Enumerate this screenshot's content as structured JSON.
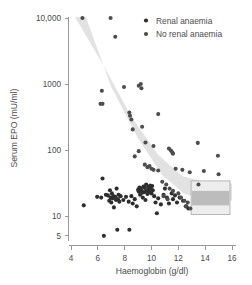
{
  "figure": {
    "name": "serum-epo-vs-haemoglobin-scatter",
    "background": "#ffffff"
  },
  "chart_data": {
    "type": "scatter",
    "title": "",
    "xlabel": "Haemoglobin (g/dl)",
    "ylabel": "Serum EPO (mU/ml)",
    "xlim": [
      3.6,
      16.4
    ],
    "ylim": [
      4.2,
      11000
    ],
    "yscale": "log",
    "xticks": [
      4,
      6,
      8,
      10,
      12,
      14,
      16
    ],
    "xtick_labels": [
      "4",
      "6",
      "8",
      "10",
      "12",
      "14",
      "16"
    ],
    "yticks": [
      5,
      10,
      100,
      1000,
      10000
    ],
    "ytick_labels": [
      "5",
      "10",
      "100",
      "1000",
      "10,000"
    ],
    "grid": false,
    "legend_position": "top-right",
    "marker_color": "#333333",
    "band_color": "#e2e2e2",
    "reference_box_color": "#ededed",
    "reference_band_color": "#bcbcbc",
    "series": [
      {
        "name": "Renal anaemia",
        "marker_color": "#2e2e2e",
        "points": [
          [
            4.95,
            14.5
          ],
          [
            5.95,
            19.5
          ],
          [
            6.25,
            19.0
          ],
          [
            6.35,
            37.0
          ],
          [
            6.45,
            5.0
          ],
          [
            6.6,
            21.0
          ],
          [
            6.75,
            20.5
          ],
          [
            6.85,
            17.0
          ],
          [
            6.9,
            24.5
          ],
          [
            6.95,
            19.0
          ],
          [
            7.0,
            16.0
          ],
          [
            7.05,
            22.0
          ],
          [
            7.1,
            18.5
          ],
          [
            7.15,
            20.0
          ],
          [
            7.2,
            13.5
          ],
          [
            7.3,
            19.5
          ],
          [
            7.35,
            17.5
          ],
          [
            7.4,
            26.0
          ],
          [
            7.45,
            6.2
          ],
          [
            7.5,
            18.0
          ],
          [
            7.55,
            21.0
          ],
          [
            7.6,
            16.5
          ],
          [
            7.7,
            20.0
          ],
          [
            7.9,
            17.5
          ],
          [
            8.1,
            19.5
          ],
          [
            8.3,
            16.5
          ],
          [
            8.35,
            6.2
          ],
          [
            8.5,
            20.0
          ],
          [
            8.6,
            15.5
          ],
          [
            8.75,
            18.0
          ],
          [
            8.9,
            14.0
          ],
          [
            9.0,
            25.0
          ],
          [
            9.05,
            23.5
          ],
          [
            9.1,
            27.0
          ],
          [
            9.15,
            21.0
          ],
          [
            9.2,
            26.0
          ],
          [
            9.25,
            24.0
          ],
          [
            9.3,
            22.5
          ],
          [
            9.35,
            19.0
          ],
          [
            9.4,
            28.0
          ],
          [
            9.45,
            23.0
          ],
          [
            9.5,
            26.5
          ],
          [
            9.55,
            17.5
          ],
          [
            9.6,
            30.0
          ],
          [
            9.65,
            24.0
          ],
          [
            9.7,
            21.5
          ],
          [
            9.75,
            27.5
          ],
          [
            9.8,
            25.5
          ],
          [
            9.85,
            23.0
          ],
          [
            9.9,
            29.0
          ],
          [
            9.95,
            26.0
          ],
          [
            10.0,
            22.0
          ],
          [
            10.05,
            28.5
          ],
          [
            10.1,
            24.5
          ],
          [
            10.2,
            20.0
          ],
          [
            10.3,
            16.0
          ],
          [
            10.4,
            11.0
          ],
          [
            10.5,
            18.5
          ],
          [
            10.7,
            15.0
          ],
          [
            10.9,
            21.0
          ],
          [
            11.0,
            26.0
          ],
          [
            11.15,
            19.0
          ],
          [
            11.3,
            15.5
          ],
          [
            11.5,
            22.0
          ],
          [
            11.6,
            18.0
          ],
          [
            11.75,
            20.5
          ],
          [
            11.9,
            16.0
          ],
          [
            12.1,
            19.0
          ],
          [
            12.35,
            17.0
          ],
          [
            12.6,
            14.0
          ],
          [
            12.75,
            13.0
          ]
        ]
      },
      {
        "name": "No renal anaemia",
        "marker_color": "#4d4d4d",
        "points": [
          [
            4.85,
            10000
          ],
          [
            6.95,
            10000
          ],
          [
            7.3,
            5200
          ],
          [
            6.3,
            790
          ],
          [
            6.2,
            500
          ],
          [
            6.35,
            500
          ],
          [
            7.95,
            900
          ],
          [
            9.05,
            940
          ],
          [
            9.2,
            1000
          ],
          [
            9.25,
            860
          ],
          [
            8.35,
            370
          ],
          [
            8.4,
            330
          ],
          [
            8.5,
            290
          ],
          [
            10.5,
            350
          ],
          [
            8.6,
            205
          ],
          [
            9.3,
            225
          ],
          [
            9.55,
            130
          ],
          [
            10.15,
            115
          ],
          [
            9.05,
            96
          ],
          [
            8.75,
            80
          ],
          [
            11.3,
            105
          ],
          [
            11.45,
            98
          ],
          [
            11.55,
            92
          ],
          [
            11.6,
            88
          ],
          [
            13.45,
            128
          ],
          [
            14.95,
            82
          ],
          [
            9.5,
            60
          ],
          [
            9.7,
            55
          ],
          [
            9.85,
            57
          ],
          [
            10.0,
            52
          ],
          [
            10.15,
            50
          ],
          [
            10.5,
            49
          ],
          [
            11.8,
            52
          ],
          [
            12.3,
            50
          ],
          [
            13.9,
            48
          ],
          [
            12.85,
            46
          ],
          [
            15.0,
            43
          ],
          [
            10.8,
            33
          ],
          [
            11.1,
            30
          ],
          [
            11.35,
            26
          ],
          [
            11.6,
            24
          ],
          [
            12.0,
            22
          ],
          [
            12.2,
            19
          ],
          [
            12.45,
            17
          ],
          [
            12.7,
            16
          ],
          [
            13.5,
            30
          ],
          [
            10.9,
            20
          ],
          [
            11.2,
            18
          ],
          [
            12.55,
            14
          ],
          [
            12.9,
            13
          ]
        ]
      }
    ],
    "shaded_band": {
      "label": "expected-response-band",
      "color": "#e2e2e2",
      "upper": [
        [
          4.3,
          11000
        ],
        [
          6.5,
          1800
        ],
        [
          8.5,
          320
        ],
        [
          10.5,
          85
        ],
        [
          12.3,
          40
        ],
        [
          14.0,
          33
        ],
        [
          16.0,
          31
        ]
      ],
      "lower": [
        [
          5.1,
          11000
        ],
        [
          7.0,
          900
        ],
        [
          9.0,
          150
        ],
        [
          10.8,
          42
        ],
        [
          12.4,
          22
        ],
        [
          14.0,
          18
        ],
        [
          16.0,
          17
        ]
      ]
    },
    "reference_box": {
      "label": "normal-reference-range",
      "x_range": [
        12.95,
        15.85
      ],
      "y_range": [
        10.5,
        34
      ],
      "inner_y_range": [
        14.5,
        24
      ],
      "fill": "#ededed",
      "inner_fill": "#bcbcbc",
      "stroke": "#a8a8a8"
    },
    "annotations": []
  },
  "legend": {
    "name": "series-legend",
    "items": [
      {
        "label": "Renal anaemia",
        "marker": "filled-circle-dark",
        "color": "#2e2e2e"
      },
      {
        "label": "No renal anaemia",
        "marker": "filled-circle-gray",
        "color": "#4d4d4d"
      }
    ]
  },
  "axes": {
    "x": {
      "title": "Haemoglobin (g/dl)",
      "ticks": [
        "4",
        "6",
        "8",
        "10",
        "12",
        "14",
        "16"
      ]
    },
    "y": {
      "title": "Serum EPO (mU/ml)",
      "ticks": [
        "10,000",
        "1000",
        "100",
        "10",
        "5"
      ]
    }
  }
}
